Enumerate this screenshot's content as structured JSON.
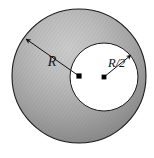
{
  "figure": {
    "canvas": {
      "width": 154,
      "height": 158,
      "background": "#ffffff"
    },
    "labels": {
      "outer_radius": "R",
      "inner_radius": "R/2"
    },
    "colors": {
      "outline": "#1a1a1a",
      "shade_light": "#c6c6c6",
      "shade_mid": "#a0a0a0",
      "shade_dark": "#7a7a7a",
      "inner_fill": "#ffffff",
      "dot": "#000000",
      "label_color": "#111111"
    },
    "geometry": {
      "outer_circle": {
        "cx": 79,
        "cy": 76,
        "r": 67
      },
      "inner_circle": {
        "cx": 104,
        "cy": 77,
        "r": 34
      },
      "outer_center_dot": {
        "cx": 79,
        "cy": 76,
        "r": 2.6
      },
      "inner_center_dot": {
        "cx": 104,
        "cy": 77,
        "r": 2.4
      },
      "outer_radius_arrow": {
        "x1": 79,
        "y1": 76,
        "x2": 24,
        "y2": 38
      },
      "inner_radius_arrow": {
        "x1": 104,
        "y1": 77,
        "x2": 133,
        "y2": 53
      },
      "outer_label_pos": {
        "x": 52,
        "y": 66
      },
      "inner_label_pos": {
        "x": 108,
        "y": 67
      }
    }
  }
}
